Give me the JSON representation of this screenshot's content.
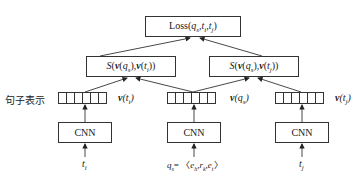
{
  "diagram": {
    "loss_box": {
      "label": "Loss(q_s,t_i,t_j)",
      "fn": "Loss",
      "args": "q",
      "sub_s": "s",
      "t": "t",
      "sub_i": "i",
      "sub_j": "j"
    },
    "similarity_left": {
      "label": "S(v(q_s),v(t_i))"
    },
    "similarity_right": {
      "label": "S(v(q_s),v(t_j))"
    },
    "row_label": "句子表示",
    "vectors": [
      {
        "name": "v(t_i)",
        "cells": 6
      },
      {
        "name": "v(q_s)",
        "cells": 6
      },
      {
        "name": "v(t_j)",
        "cells": 6
      }
    ],
    "encoders": [
      {
        "label": "CNN"
      },
      {
        "label": "CNN"
      },
      {
        "label": "CNN"
      }
    ],
    "inputs": [
      {
        "label": "t_i"
      },
      {
        "label": "q_s = ⟨e_h, r_k, e_t⟩"
      },
      {
        "label": "t_j"
      }
    ],
    "text": {
      "S": "S",
      "v": "v",
      "q": "q",
      "t": "t",
      "s": "s",
      "i": "i",
      "j": "j",
      "e": "e",
      "r": "r",
      "h": "h",
      "k": "k",
      "cnn": "CNN",
      "loss": "Loss"
    }
  }
}
